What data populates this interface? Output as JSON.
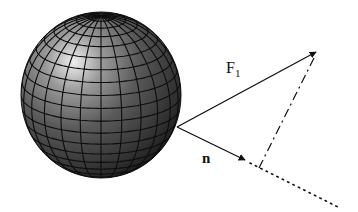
{
  "diagram": {
    "type": "vector-diagram",
    "labels": {
      "force": "F",
      "force_subscript": "1",
      "normal": "n"
    },
    "sphere": {
      "cx": 101,
      "cy": 95,
      "rx": 80,
      "ry": 83,
      "latitude_bands": 20,
      "meridians": 24
    },
    "origin": {
      "x": 177,
      "y": 127
    },
    "vectors": [
      {
        "name": "F1",
        "from": [
          177,
          127
        ],
        "to": [
          316,
          52
        ],
        "style": "solid"
      },
      {
        "name": "n",
        "from": [
          177,
          127
        ],
        "to": [
          245,
          160
        ],
        "style": "solid"
      }
    ],
    "construction_lines": [
      {
        "name": "projection-dash",
        "from": [
          316,
          52
        ],
        "to": [
          259,
          168
        ],
        "style": "dash-dot"
      },
      {
        "name": "normal-extension",
        "from": [
          250,
          163
        ],
        "to": [
          338,
          207
        ],
        "style": "dotted"
      }
    ],
    "colors": {
      "ink": "#111111",
      "sphere_dark": "#1a1a1a",
      "sphere_mid": "#555555",
      "sphere_light": "#e8e8e8",
      "grid": "#0d0d0d",
      "background": "#ffffff"
    }
  }
}
